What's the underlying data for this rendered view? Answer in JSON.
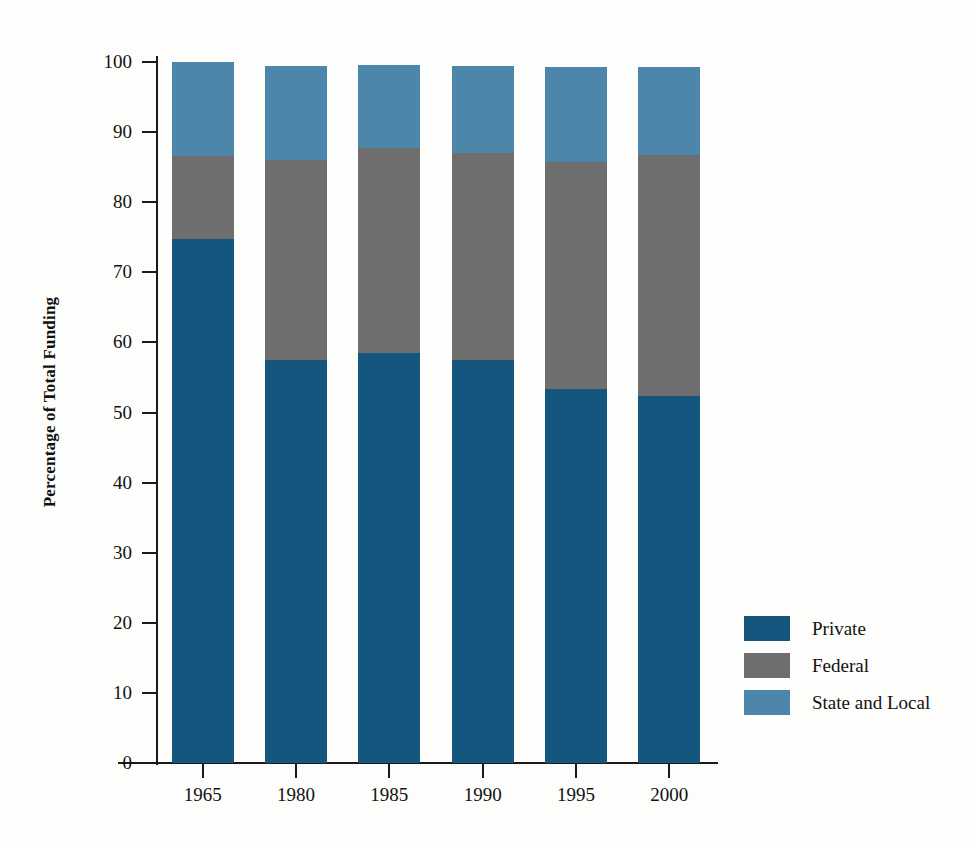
{
  "chart_data": {
    "type": "bar",
    "stacked": true,
    "title": "",
    "xlabel": "",
    "ylabel": "Percentage of Total Funding",
    "categories": [
      "1965",
      "1980",
      "1985",
      "1990",
      "1995",
      "2000"
    ],
    "series": [
      {
        "name": "Private",
        "color": "#15567f",
        "values": [
          74.8,
          57.5,
          58.5,
          57.5,
          53.3,
          52.4
        ]
      },
      {
        "name": "Federal",
        "color": "#6e6e6e",
        "values": [
          11.8,
          28.5,
          29.3,
          29.5,
          32.4,
          34.4
        ]
      },
      {
        "name": "State and Local",
        "color": "#4d86ab",
        "values": [
          13.4,
          13.4,
          11.8,
          12.5,
          13.6,
          12.5
        ]
      }
    ],
    "ylim": [
      0,
      100
    ],
    "yticks": [
      0,
      10,
      20,
      30,
      40,
      50,
      60,
      70,
      80,
      90,
      100
    ],
    "ytick_labels": [
      "0",
      "10",
      "20",
      "30",
      "40",
      "50",
      "60",
      "70",
      "80",
      "90",
      "100"
    ],
    "grid": false,
    "legend_position": "right-lower",
    "legend_entries": [
      "Private",
      "Federal",
      "State and Local"
    ]
  },
  "axes": {
    "y_title": "Percentage of Total Funding"
  },
  "colors": {
    "private": "#15567f",
    "federal": "#6e6e6e",
    "state_and_local": "#4d86ab",
    "axis": "#1a1a1a",
    "background": "#fdfdfb"
  }
}
